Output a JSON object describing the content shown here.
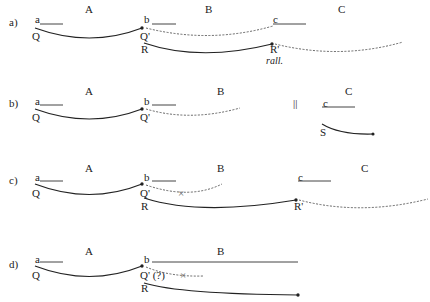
{
  "panels": [
    {
      "label": "a)",
      "sections": [
        "A",
        "B",
        "C"
      ],
      "points": [
        "a",
        "b",
        "c"
      ],
      "nodes": [
        "Q",
        "Q'",
        "R",
        "R'"
      ],
      "annotation": "rall."
    },
    {
      "label": "b)",
      "sections": [
        "A",
        "B",
        "C"
      ],
      "points": [
        "a",
        "b",
        "c"
      ],
      "nodes": [
        "Q",
        "Q'",
        "S"
      ],
      "separator": "||"
    },
    {
      "label": "c)",
      "sections": [
        "A",
        "B",
        "C"
      ],
      "points": [
        "a",
        "b",
        "c"
      ],
      "nodes": [
        "Q",
        "Q'",
        "R",
        "R'"
      ],
      "blocked_mark": "×"
    },
    {
      "label": "d)",
      "sections": [
        "A",
        "B"
      ],
      "points": [
        "a",
        "b"
      ],
      "nodes": [
        "Q",
        "Q' (?)",
        "R"
      ],
      "blocked_mark": "×"
    }
  ],
  "colors": {
    "ink": "#222222",
    "dotted": "#555555"
  }
}
